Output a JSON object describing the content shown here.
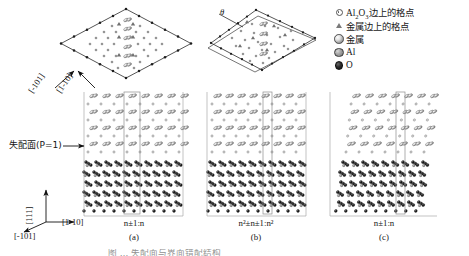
{
  "figure": {
    "domain": "crystallography-interface-diagram",
    "background": "#ffffff",
    "caption_partial": "图 … 失配面与界面错配结构"
  },
  "legend": {
    "items": [
      {
        "marker": "ring-dot-icon",
        "label_html": "Al₂O₃边上的格点",
        "label": "Al2O3边上的格点"
      },
      {
        "marker": "triangle-icon",
        "label_html": "金属边上的格点",
        "label": "金属边上的格点"
      },
      {
        "marker": "metal-sphere-icon",
        "label_html": "金属",
        "label": "金属"
      },
      {
        "marker": "al-sphere-icon",
        "label_html": "Al",
        "label": "Al"
      },
      {
        "marker": "o-sphere-icon",
        "label_html": "O",
        "label": "O"
      }
    ]
  },
  "annotations": {
    "theta": "θ",
    "misfit_plane": "失配面(P=1)",
    "misfit_plane_plain": "失配面(P=1)",
    "top_dir_left": "[-101]",
    "top_dir_right": "[1-10]",
    "axis_vertical": "[111]",
    "axis_left": "[-101]",
    "axis_right": "[1-10]"
  },
  "panels": [
    {
      "id": "a",
      "ratio": "n±1:n",
      "ratio_plain": "n±1:n",
      "label": "(a)"
    },
    {
      "id": "b",
      "ratio": "n²±n±1:n²",
      "ratio_plain": "n2±n±1:n2",
      "label": "(b)"
    },
    {
      "id": "c",
      "ratio": "n±1:n",
      "ratio_plain": "n±1:n",
      "label": "(c)"
    }
  ],
  "colors": {
    "ink": "#1a1a1a",
    "metal_atom": "#9a9a9a",
    "al_atom": "#8a8a8a",
    "o_atom": "#1f1f1f",
    "box_line": "#8d8d8d",
    "diamond_line": "#2a2a2a"
  }
}
